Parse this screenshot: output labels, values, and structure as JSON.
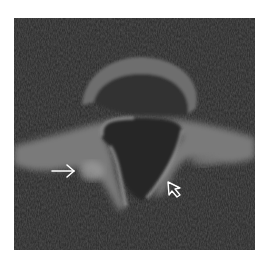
{
  "image": {
    "type": "axial CT slice",
    "subject": "vertebra",
    "background_color": "#ffffff",
    "scan_background": "#2a2a2a",
    "bone_color": "#9a9a9a"
  },
  "annotations": [
    {
      "kind": "arrow",
      "name": "white-arrow",
      "direction": "right",
      "color": "#ffffff"
    },
    {
      "kind": "arrowhead",
      "name": "open-arrowhead",
      "direction": "up-left",
      "color": "#ffffff"
    }
  ]
}
